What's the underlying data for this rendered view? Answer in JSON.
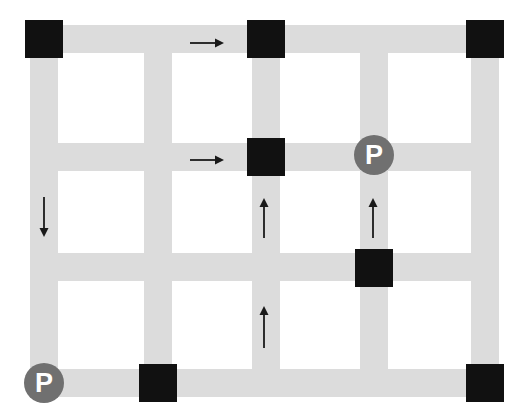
{
  "diagram": {
    "canvas": {
      "width": 530,
      "height": 420,
      "background": "#ffffff"
    },
    "colors": {
      "road": "#dcdcdc",
      "blocked": "#111111",
      "marker_fill": "#707070",
      "marker_text": "#ffffff",
      "arrow": "#1a1a1a"
    },
    "road_width": 28,
    "block_size": 38,
    "grid": {
      "vertical_centers": [
        44,
        158,
        266,
        374,
        485
      ],
      "horizontal_centers": [
        39,
        157,
        267,
        383
      ],
      "columns": 5,
      "rows": 4
    },
    "roads": {
      "horizontal": [
        {
          "name": "h-row-1",
          "y": 39,
          "x1": 30,
          "x2": 499
        },
        {
          "name": "h-row-2",
          "y": 157,
          "x1": 30,
          "x2": 499
        },
        {
          "name": "h-row-3",
          "y": 267,
          "x1": 30,
          "x2": 499
        },
        {
          "name": "h-row-4",
          "y": 383,
          "x1": 30,
          "x2": 499
        }
      ],
      "vertical": [
        {
          "name": "v-col-1",
          "x": 44,
          "y1": 25,
          "y2": 397
        },
        {
          "name": "v-col-2",
          "x": 158,
          "y1": 25,
          "y2": 397
        },
        {
          "name": "v-col-3",
          "x": 266,
          "y1": 25,
          "y2": 397
        },
        {
          "name": "v-col-4",
          "x": 374,
          "y1": 25,
          "y2": 397
        },
        {
          "name": "v-col-5",
          "x": 485,
          "y1": 25,
          "y2": 397
        }
      ]
    },
    "blocked_intersections": [
      {
        "name": "blocked-r1c1",
        "cx": 44,
        "cy": 39
      },
      {
        "name": "blocked-r1c3",
        "cx": 266,
        "cy": 39
      },
      {
        "name": "blocked-r1c5",
        "cx": 485,
        "cy": 39
      },
      {
        "name": "blocked-r2c3",
        "cx": 266,
        "cy": 157
      },
      {
        "name": "blocked-mid-c4",
        "cx": 374,
        "cy": 268
      },
      {
        "name": "blocked-r4c2",
        "cx": 158,
        "cy": 383
      },
      {
        "name": "blocked-r4c5",
        "cx": 485,
        "cy": 383
      }
    ],
    "arrows": [
      {
        "name": "arrow-right-top",
        "direction": "right",
        "x": 190,
        "y": 43,
        "length": 34
      },
      {
        "name": "arrow-right-middle",
        "direction": "right",
        "x": 190,
        "y": 160,
        "length": 34
      },
      {
        "name": "arrow-down-left",
        "direction": "down",
        "x": 44,
        "y": 197,
        "length": 40
      },
      {
        "name": "arrow-up-center",
        "direction": "up",
        "x": 264,
        "y": 198,
        "length": 40
      },
      {
        "name": "arrow-up-right",
        "direction": "up",
        "x": 373,
        "y": 198,
        "length": 40
      },
      {
        "name": "arrow-up-bottom-center",
        "direction": "up",
        "x": 264,
        "y": 306,
        "length": 42
      }
    ],
    "parking_markers": [
      {
        "name": "parking-marker-upper-right",
        "label": "P",
        "cx": 374,
        "cy": 155,
        "r": 20
      },
      {
        "name": "parking-marker-lower-left",
        "label": "P",
        "cx": 44,
        "cy": 383,
        "r": 20
      }
    ]
  }
}
